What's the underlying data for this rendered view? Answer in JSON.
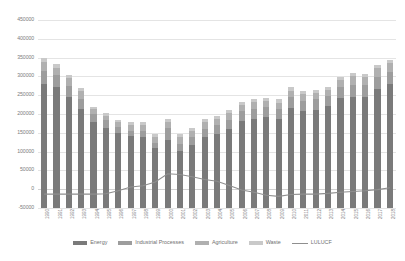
{
  "chart_data": {
    "type": "bar",
    "title": "",
    "xlabel": "",
    "ylabel": "",
    "ylim": [
      -50000,
      450000
    ],
    "ytick_step": 50000,
    "yticks": [
      "450000",
      "400000",
      "350000",
      "300000",
      "250000",
      "200000",
      "150000",
      "100000",
      "50000",
      "0",
      "-50000"
    ],
    "grid": true,
    "stacked": true,
    "legend_position": "bottom",
    "categories": [
      "1990",
      "1991",
      "1992",
      "1993",
      "1994",
      "1995",
      "1996",
      "1997",
      "1998",
      "1999",
      "2000",
      "2001",
      "2002",
      "2003",
      "2004",
      "2005",
      "2006",
      "2007",
      "2008",
      "2009",
      "2010",
      "2011",
      "2012",
      "2013",
      "2014",
      "2015",
      "2016",
      "2017",
      "2018"
    ],
    "series": [
      {
        "name": "Energy",
        "type": "bar",
        "color": "#7a7a7a",
        "values": [
          330000,
          321000,
          294000,
          263000,
          228000,
          212000,
          200000,
          191000,
          189000,
          160000,
          182000,
          152000,
          168000,
          188000,
          197000,
          209000,
          232000,
          237000,
          242000,
          237000,
          266000,
          257000,
          262000,
          270000,
          293000,
          296000,
          295000,
          316000,
          330000
        ]
      },
      {
        "name": "Industrial Processes",
        "type": "bar",
        "color": "#9d9d9d",
        "values": [
          34000,
          33000,
          31000,
          28000,
          22000,
          21000,
          15000,
          15000,
          16000,
          14000,
          31000,
          19000,
          20000,
          22000,
          24000,
          25000,
          26000,
          26000,
          27000,
          26000,
          29000,
          28000,
          28000,
          28000,
          30000,
          30000,
          31000,
          32000,
          33000
        ]
      },
      {
        "name": "Agriculture",
        "type": "bar",
        "color": "#b0b0b0",
        "values": [
          24000,
          19000,
          20000,
          19000,
          13000,
          13000,
          13000,
          14000,
          17000,
          16000,
          16000,
          17000,
          18000,
          18000,
          17000,
          18000,
          15000,
          18000,
          15000,
          17000,
          17000,
          17000,
          17000,
          17000,
          17000,
          24000,
          23000,
          25000,
          23000
        ]
      },
      {
        "name": "Waste",
        "type": "bar",
        "color": "#c9c9c9",
        "values": [
          11000,
          10000,
          10000,
          9000,
          7000,
          7000,
          7000,
          8000,
          7000,
          8000,
          8000,
          8000,
          8000,
          8000,
          8000,
          9000,
          9000,
          9000,
          9000,
          9000,
          9000,
          8000,
          8000,
          8000,
          8000,
          8000,
          8000,
          8000,
          8000
        ]
      },
      {
        "name": "LULUCF",
        "type": "line",
        "color": "#8f8f8f",
        "values": [
          -13000,
          -13000,
          -13000,
          -13000,
          -13000,
          -12000,
          -4000,
          6000,
          9000,
          19000,
          41000,
          39000,
          33000,
          26000,
          21000,
          10000,
          -2000,
          -8000,
          -16000,
          -19000,
          -14000,
          -13000,
          -13000,
          -11000,
          -8000,
          -6000,
          -4000,
          -1000,
          4000
        ]
      }
    ]
  },
  "legend": {
    "items": [
      {
        "label": "Energy",
        "key": "energy",
        "marker": "swatch"
      },
      {
        "label": "Industrial Processes",
        "key": "industrial",
        "marker": "swatch"
      },
      {
        "label": "Agriculture",
        "key": "agriculture",
        "marker": "swatch"
      },
      {
        "label": "Waste",
        "key": "waste",
        "marker": "swatch"
      },
      {
        "label": "LULUCF",
        "key": "lulucf",
        "marker": "line"
      }
    ]
  }
}
